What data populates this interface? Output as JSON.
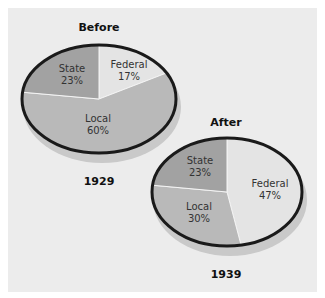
{
  "chart_data": [
    {
      "type": "pie",
      "title": "Before",
      "caption": "1929",
      "categories": [
        "Federal",
        "Local",
        "State"
      ],
      "values": [
        17,
        60,
        23
      ],
      "labels": [
        "17%",
        "60%",
        "23%"
      ],
      "colors": [
        "#e4e4e4",
        "#b9b9b9",
        "#a2a2a2"
      ]
    },
    {
      "type": "pie",
      "title": "After",
      "caption": "1939",
      "categories": [
        "Federal",
        "Local",
        "State"
      ],
      "values": [
        47,
        30,
        23
      ],
      "labels": [
        "47%",
        "30%",
        "23%"
      ],
      "colors": [
        "#e4e4e4",
        "#b9b9b9",
        "#a2a2a2"
      ]
    }
  ],
  "before": {
    "title": "Before",
    "year": "1929",
    "federal": {
      "name": "Federal",
      "pct": "17%"
    },
    "local": {
      "name": "Local",
      "pct": "60%"
    },
    "state": {
      "name": "State",
      "pct": "23%"
    }
  },
  "after": {
    "title": "After",
    "year": "1939",
    "federal": {
      "name": "Federal",
      "pct": "47%"
    },
    "local": {
      "name": "Local",
      "pct": "30%"
    },
    "state": {
      "name": "State",
      "pct": "23%"
    }
  },
  "colors": {
    "background": "#ececec",
    "federal": "#e4e4e4",
    "local": "#b9b9b9",
    "state": "#a2a2a2",
    "outline": "#1a1a1a",
    "edge": "#c9c9c9"
  }
}
